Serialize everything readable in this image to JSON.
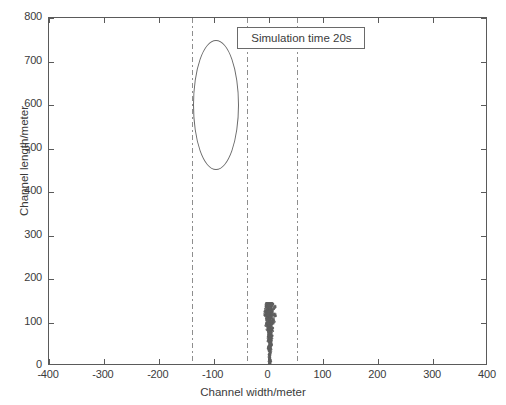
{
  "chart_data": {
    "type": "scatter",
    "title": "",
    "xlabel": "Channel width/meter",
    "ylabel": "Channel length/meter",
    "xlim": [
      -400,
      400
    ],
    "ylim": [
      0,
      800
    ],
    "xticks": [
      -400,
      -300,
      -200,
      -100,
      0,
      100,
      200,
      300,
      400
    ],
    "xticklabels": [
      "-400",
      "-300",
      "-200",
      "-100",
      "0",
      "100",
      "200",
      "300",
      "400"
    ],
    "yticks": [
      0,
      100,
      200,
      300,
      400,
      500,
      600,
      700,
      800
    ],
    "yticklabels": [
      "0",
      "100",
      "200",
      "300",
      "400",
      "500",
      "600",
      "700",
      "800"
    ],
    "grid": false,
    "legend": null,
    "annotations": [
      {
        "name": "simulation-time-label",
        "text": "Simulation time 20s",
        "x": 60,
        "y": 755,
        "boxed": true
      }
    ],
    "reference_lines": [
      {
        "name": "channel-boundary-left",
        "orientation": "vertical",
        "x": -140,
        "style": "dash-dot",
        "color": "#8e8e8e"
      },
      {
        "name": "channel-boundary-mid",
        "orientation": "vertical",
        "x": -40,
        "style": "dash-dot",
        "color": "#8e8e8e"
      },
      {
        "name": "channel-boundary-right",
        "orientation": "vertical",
        "x": 52,
        "style": "dash-dot",
        "color": "#8e8e8e"
      }
    ],
    "series": [
      {
        "name": "concentration-contour",
        "type": "contour-ellipse",
        "color": "#6a6a6a",
        "filled": false,
        "center_x": -96,
        "center_y": 600,
        "semi_axis_x": 42,
        "semi_axis_y": 150
      },
      {
        "name": "particle-plume",
        "type": "particle-cloud",
        "color": "#5e5e5e",
        "x_range": [
          -14,
          22
        ],
        "y_range": [
          0,
          148
        ],
        "apex_x": 2,
        "apex_y": 148,
        "base_x": 0,
        "base_y": 0,
        "point_count": 420
      }
    ]
  },
  "axes": {
    "frame_color": "#5a5a5a",
    "background": "#ffffff"
  }
}
